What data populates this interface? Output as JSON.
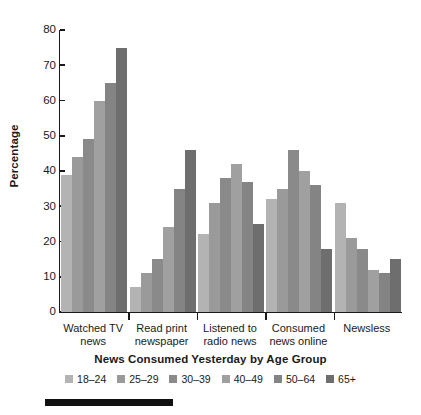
{
  "chart_data": {
    "type": "bar",
    "title": "",
    "xlabel": "News Consumed Yesterday by Age Group",
    "ylabel": "Percentage",
    "ylim": [
      0,
      80
    ],
    "yticks": [
      0,
      10,
      20,
      30,
      40,
      50,
      60,
      70,
      80
    ],
    "grid": false,
    "legend_position": "bottom",
    "categories": [
      "Watched TV\nnews",
      "Read print\nnewspaper",
      "Listened to\nradio news",
      "Consumed\nnews online",
      "Newsless"
    ],
    "series": [
      {
        "name": "18–24",
        "color": "#b3b3b3",
        "values": [
          39,
          7,
          22,
          32,
          31
        ]
      },
      {
        "name": "25–29",
        "color": "#9a9a9a",
        "values": [
          44,
          11,
          31,
          35,
          21
        ]
      },
      {
        "name": "30–39",
        "color": "#8a8a8a",
        "values": [
          49,
          15,
          38,
          46,
          18
        ]
      },
      {
        "name": "40–49",
        "color": "#a0a0a0",
        "values": [
          60,
          24,
          42,
          40,
          12
        ]
      },
      {
        "name": "50–64",
        "color": "#848484",
        "values": [
          65,
          35,
          37,
          36,
          11
        ]
      },
      {
        "name": "65+",
        "color": "#6e6e6e",
        "values": [
          75,
          46,
          25,
          18,
          15
        ]
      }
    ]
  },
  "axis": {
    "y_title": "Percentage",
    "x_title": "News Consumed Yesterday by Age Group"
  }
}
